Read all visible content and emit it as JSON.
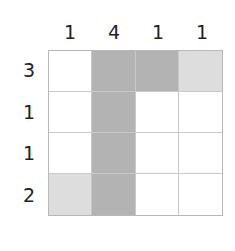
{
  "puzzle": {
    "type": "nonogram",
    "size": 4,
    "column_clues": [
      "1",
      "4",
      "1",
      "1"
    ],
    "row_clues": [
      "3",
      "1",
      "1",
      "2"
    ],
    "cells": [
      [
        "empty",
        "filled",
        "filled",
        "marked"
      ],
      [
        "empty",
        "filled",
        "empty",
        "empty"
      ],
      [
        "empty",
        "filled",
        "empty",
        "empty"
      ],
      [
        "marked",
        "filled",
        "empty",
        "empty"
      ]
    ],
    "colors": {
      "filled": "#b3b3b3",
      "marked": "#dddddd",
      "empty": "#ffffff",
      "grid_line": "#c9c9c9"
    }
  }
}
